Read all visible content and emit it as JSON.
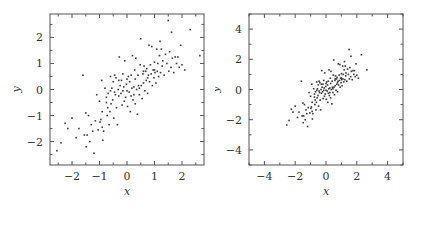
{
  "chart_data": [
    {
      "type": "scatter",
      "title": "",
      "xlabel": "x",
      "ylabel": "y",
      "xlim": [
        -2.8,
        2.8
      ],
      "ylim": [
        -2.9,
        2.9
      ],
      "xticks": [
        -2,
        -1,
        0,
        1,
        2
      ],
      "yticks": [
        -2,
        -1,
        0,
        1,
        2
      ],
      "grid": false,
      "legend": null,
      "frame": {
        "left": 50,
        "top": 14,
        "right": 204,
        "bottom": 165
      },
      "points_ref": "shared_points"
    },
    {
      "type": "scatter",
      "title": "",
      "xlabel": "x",
      "ylabel": "y",
      "xlim": [
        -5,
        5
      ],
      "ylim": [
        -5,
        5
      ],
      "xticks": [
        -4,
        -2,
        0,
        2,
        4
      ],
      "yticks": [
        -4,
        -2,
        0,
        2,
        4
      ],
      "grid": false,
      "legend": null,
      "frame": {
        "left": 249,
        "top": 14,
        "right": 403,
        "bottom": 165
      },
      "points_ref": "shared_points"
    }
  ],
  "shared_points": [
    [
      -2.55,
      -2.35
    ],
    [
      -2.4,
      -2.05
    ],
    [
      -2.25,
      -1.3
    ],
    [
      -2.15,
      -1.5
    ],
    [
      -2.0,
      -1.1
    ],
    [
      -1.85,
      -1.85
    ],
    [
      -1.75,
      -1.5
    ],
    [
      -1.6,
      0.55
    ],
    [
      -1.55,
      -1.75
    ],
    [
      -1.5,
      -0.9
    ],
    [
      -1.48,
      -2.2
    ],
    [
      -1.45,
      -1.75
    ],
    [
      -1.4,
      -1.0
    ],
    [
      -1.35,
      -2.0
    ],
    [
      -1.3,
      -1.35
    ],
    [
      -1.25,
      -1.6
    ],
    [
      -1.2,
      -2.45
    ],
    [
      -1.15,
      -1.2
    ],
    [
      -1.1,
      -0.2
    ],
    [
      -1.05,
      -1.55
    ],
    [
      -1.0,
      -0.45
    ],
    [
      -0.98,
      -1.25
    ],
    [
      -0.95,
      -1.15
    ],
    [
      -0.92,
      0.35
    ],
    [
      -0.9,
      -1.45
    ],
    [
      -0.88,
      -1.95
    ],
    [
      -0.85,
      -1.6
    ],
    [
      -0.8,
      0.05
    ],
    [
      -0.75,
      -0.3
    ],
    [
      -0.72,
      -1.0
    ],
    [
      -0.7,
      -0.7
    ],
    [
      -0.68,
      -0.15
    ],
    [
      -0.65,
      -1.35
    ],
    [
      -0.62,
      -0.85
    ],
    [
      -0.6,
      0.5
    ],
    [
      -0.58,
      -0.55
    ],
    [
      -0.55,
      0.05
    ],
    [
      -0.52,
      -0.4
    ],
    [
      -0.5,
      0.3
    ],
    [
      -0.48,
      -1.1
    ],
    [
      -0.45,
      -0.1
    ],
    [
      -0.42,
      -0.2
    ],
    [
      -0.4,
      0.45
    ],
    [
      -0.38,
      -0.7
    ],
    [
      -0.35,
      -1.35
    ],
    [
      -0.32,
      0.0
    ],
    [
      -0.3,
      -0.25
    ],
    [
      -0.28,
      1.25
    ],
    [
      -0.25,
      0.15
    ],
    [
      -0.22,
      -0.15
    ],
    [
      -0.2,
      0.35
    ],
    [
      -0.18,
      -0.6
    ],
    [
      -0.15,
      0.6
    ],
    [
      -0.12,
      0.1
    ],
    [
      -0.1,
      -0.45
    ],
    [
      -0.08,
      1.1
    ],
    [
      -0.05,
      -0.3
    ],
    [
      -0.02,
      0.2
    ],
    [
      0.0,
      0.4
    ],
    [
      0.02,
      -0.65
    ],
    [
      0.05,
      0.5
    ],
    [
      0.08,
      -0.1
    ],
    [
      0.1,
      0.3
    ],
    [
      0.12,
      -0.85
    ],
    [
      0.15,
      -0.25
    ],
    [
      0.18,
      0.05
    ],
    [
      0.2,
      1.3
    ],
    [
      0.22,
      -0.4
    ],
    [
      0.25,
      0.1
    ],
    [
      0.28,
      0.75
    ],
    [
      0.3,
      -0.55
    ],
    [
      0.32,
      1.2
    ],
    [
      0.35,
      0.0
    ],
    [
      0.38,
      -0.95
    ],
    [
      0.4,
      0.55
    ],
    [
      0.42,
      0.15
    ],
    [
      0.45,
      -0.2
    ],
    [
      0.48,
      0.95
    ],
    [
      0.5,
      1.95
    ],
    [
      0.52,
      0.15
    ],
    [
      0.55,
      -0.35
    ],
    [
      0.58,
      0.6
    ],
    [
      0.6,
      0.25
    ],
    [
      0.62,
      0.9
    ],
    [
      0.65,
      -0.05
    ],
    [
      0.68,
      0.7
    ],
    [
      0.7,
      0.35
    ],
    [
      0.72,
      0.8
    ],
    [
      0.75,
      -0.15
    ],
    [
      0.78,
      0.55
    ],
    [
      0.8,
      1.7
    ],
    [
      0.82,
      0.3
    ],
    [
      0.85,
      0.95
    ],
    [
      0.88,
      0.6
    ],
    [
      0.9,
      1.65
    ],
    [
      0.92,
      0.15
    ],
    [
      0.95,
      0.75
    ],
    [
      0.98,
      0.45
    ],
    [
      1.0,
      1.05
    ],
    [
      1.02,
      0.65
    ],
    [
      1.05,
      0.25
    ],
    [
      1.08,
      1.55
    ],
    [
      1.1,
      0.7
    ],
    [
      1.12,
      1.0
    ],
    [
      1.15,
      0.5
    ],
    [
      1.18,
      1.3
    ],
    [
      1.2,
      1.85
    ],
    [
      1.22,
      0.65
    ],
    [
      1.25,
      1.55
    ],
    [
      1.28,
      0.9
    ],
    [
      1.3,
      1.1
    ],
    [
      1.35,
      0.55
    ],
    [
      1.4,
      1.35
    ],
    [
      1.45,
      1.0
    ],
    [
      1.5,
      2.65
    ],
    [
      1.52,
      0.7
    ],
    [
      1.55,
      1.45
    ],
    [
      1.6,
      0.85
    ],
    [
      1.62,
      2.2
    ],
    [
      1.65,
      1.2
    ],
    [
      1.7,
      0.65
    ],
    [
      1.75,
      1.25
    ],
    [
      1.8,
      1.0
    ],
    [
      1.85,
      1.25
    ],
    [
      1.9,
      0.85
    ],
    [
      1.95,
      1.7
    ],
    [
      2.0,
      0.95
    ],
    [
      2.1,
      0.75
    ],
    [
      2.3,
      2.3
    ],
    [
      2.65,
      1.3
    ],
    [
      -0.3,
      0.35
    ],
    [
      0.0,
      -0.05
    ],
    [
      0.3,
      0.4
    ],
    [
      -0.6,
      -0.05
    ],
    [
      0.6,
      0.7
    ],
    [
      -0.9,
      -0.85
    ],
    [
      0.15,
      0.55
    ],
    [
      -0.15,
      -0.05
    ],
    [
      0.45,
      0.05
    ],
    [
      -0.45,
      0.55
    ],
    [
      0.75,
      0.45
    ],
    [
      -0.75,
      -0.5
    ],
    [
      1.0,
      0.75
    ],
    [
      0.25,
      -0.2
    ]
  ]
}
